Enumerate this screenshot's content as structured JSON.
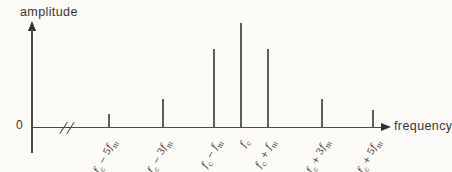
{
  "figure": {
    "y_axis_label": "amplitude",
    "x_axis_label": "frequency",
    "origin_label": "0"
  },
  "colors": {
    "background": "#fcfbf8",
    "axis": "#4a4a4a",
    "spectral_line": "#5d5d5d",
    "text": "#38352f"
  },
  "layout": {
    "axis_y_px": 127,
    "label_anchor_top_px": 134,
    "figure_width_px": 452,
    "label_rotation_deg": -62
  },
  "chart_data": {
    "type": "bar",
    "subtype": "stem-spectrum",
    "title": "",
    "xlabel": "frequency",
    "ylabel": "amplitude",
    "x_axis_break_between_origin_and_first_line": true,
    "categories": [
      "fc − 5fm",
      "fc − 3fm",
      "fc − fm",
      "fc",
      "fc + fm",
      "fc + 3fm",
      "fc + 5fm"
    ],
    "values": [
      0.12,
      0.27,
      0.75,
      1.0,
      0.75,
      0.27,
      0.16
    ],
    "ylim": [
      0,
      1
    ],
    "grid": false,
    "legend": false,
    "lines": [
      {
        "offset_fm": -5,
        "amplitude_rel": 0.12,
        "x_px": 109,
        "height_px": 13,
        "label_text": "fc − 5fm",
        "label_segments": [
          {
            "t": "f",
            "s": "i"
          },
          {
            "t": "c",
            "s": "b"
          },
          {
            "t": " − ",
            "s": "o"
          },
          {
            "t": "5",
            "s": "n"
          },
          {
            "t": "f",
            "s": "i"
          },
          {
            "t": "m",
            "s": "b"
          }
        ]
      },
      {
        "offset_fm": -3,
        "amplitude_rel": 0.27,
        "x_px": 163,
        "height_px": 28,
        "label_text": "fc − 3fm",
        "label_segments": [
          {
            "t": "f",
            "s": "i"
          },
          {
            "t": "c",
            "s": "b"
          },
          {
            "t": " − ",
            "s": "o"
          },
          {
            "t": "3",
            "s": "n"
          },
          {
            "t": "f",
            "s": "i"
          },
          {
            "t": "m",
            "s": "b"
          }
        ]
      },
      {
        "offset_fm": -1,
        "amplitude_rel": 0.75,
        "x_px": 214,
        "height_px": 78,
        "label_text": "fc − fm",
        "label_segments": [
          {
            "t": "f",
            "s": "i"
          },
          {
            "t": "c",
            "s": "b"
          },
          {
            "t": " − ",
            "s": "o"
          },
          {
            "t": "f",
            "s": "i"
          },
          {
            "t": "m",
            "s": "b"
          }
        ]
      },
      {
        "offset_fm": 0,
        "amplitude_rel": 1.0,
        "x_px": 241,
        "height_px": 104,
        "label_text": "fc",
        "label_segments": [
          {
            "t": "f",
            "s": "i"
          },
          {
            "t": "c",
            "s": "b"
          }
        ]
      },
      {
        "offset_fm": 1,
        "amplitude_rel": 0.75,
        "x_px": 268,
        "height_px": 78,
        "label_text": "fc + fm",
        "label_segments": [
          {
            "t": "f",
            "s": "i"
          },
          {
            "t": "c",
            "s": "b"
          },
          {
            "t": " + ",
            "s": "o"
          },
          {
            "t": "f",
            "s": "i"
          },
          {
            "t": "m",
            "s": "b"
          }
        ]
      },
      {
        "offset_fm": 3,
        "amplitude_rel": 0.27,
        "x_px": 322,
        "height_px": 28,
        "label_text": "fc + 3fm",
        "label_segments": [
          {
            "t": "f",
            "s": "i"
          },
          {
            "t": "c",
            "s": "b"
          },
          {
            "t": " + ",
            "s": "o"
          },
          {
            "t": "3",
            "s": "n"
          },
          {
            "t": "f",
            "s": "i"
          },
          {
            "t": "m",
            "s": "b"
          }
        ]
      },
      {
        "offset_fm": 5,
        "amplitude_rel": 0.16,
        "x_px": 373,
        "height_px": 17,
        "label_text": "fc + 5fm",
        "label_segments": [
          {
            "t": "f",
            "s": "i"
          },
          {
            "t": "c",
            "s": "b"
          },
          {
            "t": " + ",
            "s": "o"
          },
          {
            "t": "5",
            "s": "n"
          },
          {
            "t": "f",
            "s": "i"
          },
          {
            "t": "m",
            "s": "b"
          }
        ]
      }
    ]
  }
}
